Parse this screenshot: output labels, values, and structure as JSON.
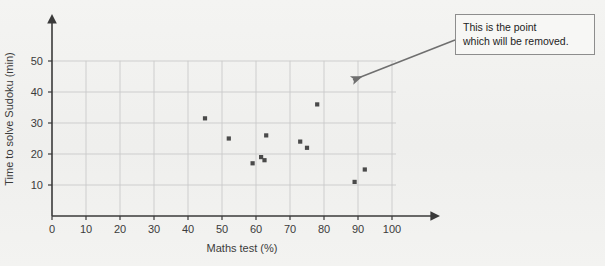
{
  "annotation": {
    "line1": "This is the point",
    "line2": "which will be removed."
  },
  "chart_data": {
    "type": "scatter",
    "title": "",
    "xlabel": "Maths test (%)",
    "ylabel": "Time to solve Sudoku (min)",
    "xlim": [
      0,
      100
    ],
    "ylim": [
      0,
      52
    ],
    "xticks": [
      0,
      10,
      20,
      30,
      40,
      50,
      60,
      70,
      80,
      90,
      100
    ],
    "yticks": [
      10,
      20,
      30,
      40,
      50
    ],
    "xtick_labels": [
      "0",
      "10",
      "20",
      "30",
      "40",
      "50",
      "60",
      "70",
      "80",
      "90",
      "100"
    ],
    "ytick_labels": [
      "10",
      "20",
      "30",
      "40",
      "50"
    ],
    "grid": true,
    "grid_color": "#c9c9c9",
    "axis_color": "#3a3a3a",
    "marker_color": "#4a4a4a",
    "marker_shape": "square",
    "legend": null,
    "points": [
      {
        "x": 45,
        "y": 31.5
      },
      {
        "x": 52,
        "y": 25
      },
      {
        "x": 59,
        "y": 17
      },
      {
        "x": 61.5,
        "y": 19
      },
      {
        "x": 62.5,
        "y": 18
      },
      {
        "x": 63,
        "y": 26
      },
      {
        "x": 73,
        "y": 24
      },
      {
        "x": 75,
        "y": 22
      },
      {
        "x": 78,
        "y": 36,
        "highlighted": true
      },
      {
        "x": 89,
        "y": 11
      },
      {
        "x": 92,
        "y": 15
      }
    ],
    "annotations": [
      {
        "text": "This is the point which will be removed.",
        "points_to": {
          "x": 78,
          "y": 36
        },
        "arrow": true
      }
    ]
  }
}
